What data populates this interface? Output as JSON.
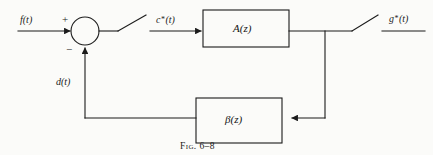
{
  "figure": {
    "caption": "Fig. 6–8",
    "type": "block-diagram",
    "colors": {
      "line": "#1b1b1b",
      "background": "#fbfbf9",
      "text": "#1b1b1b"
    }
  },
  "signals": {
    "input": "f(t)",
    "error_sampled_pre": "c",
    "error_sampled_post": "(t)",
    "output_pre": "g",
    "output_post": "(t)",
    "feedback": "d(t)",
    "star": "*"
  },
  "summing_junction": {
    "name": "summing-junction",
    "plus_sign": "+",
    "minus_sign": "−"
  },
  "blocks": [
    {
      "id": "forward",
      "label": "A(z)"
    },
    {
      "id": "feedback",
      "label": "β(z)"
    }
  ],
  "switches": [
    {
      "id": "input-sampler",
      "label": ""
    },
    {
      "id": "output-sampler",
      "label": ""
    }
  ]
}
